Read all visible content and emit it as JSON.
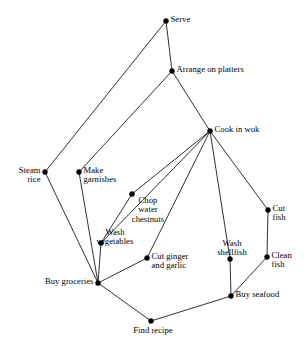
{
  "diagram": {
    "type": "node-link-graph",
    "width": 307,
    "height": 341,
    "background_color": "#ffffff",
    "node_color": "#000000",
    "edge_color": "#1a1a1a",
    "nodes": [
      {
        "id": "serve",
        "label": "Serve",
        "x": 166,
        "y": 21,
        "anchor": "right",
        "lines": [
          "Serve"
        ]
      },
      {
        "id": "arrange",
        "label": "Arrange on platters",
        "x": 172,
        "y": 71,
        "anchor": "right",
        "lines": [
          "Arrange on platters"
        ]
      },
      {
        "id": "cook",
        "label": "Cook in wok",
        "x": 210,
        "y": 131,
        "anchor": "right",
        "lines": [
          "Cook in wok"
        ]
      },
      {
        "id": "steam",
        "label": "Steam rice",
        "x": 45,
        "y": 172,
        "anchor": "left",
        "lines": [
          "Steam",
          "rice"
        ]
      },
      {
        "id": "garnishes",
        "label": "Make garnishes",
        "x": 79,
        "y": 172,
        "anchor": "right",
        "lines": [
          "Make",
          "garnishes"
        ]
      },
      {
        "id": "chestnuts",
        "label": "Chop water chestnuts",
        "x": 132,
        "y": 194,
        "anchor": "below",
        "lines": [
          "Chop",
          "water",
          "chestnuts"
        ]
      },
      {
        "id": "cutfish",
        "label": "Cut fish",
        "x": 268,
        "y": 210,
        "anchor": "right",
        "lines": [
          "Cut",
          "fish"
        ]
      },
      {
        "id": "washveg",
        "label": "Wash vegetables",
        "x": 101,
        "y": 243,
        "anchor": "above",
        "lines": [
          "Wash",
          "vegetables"
        ]
      },
      {
        "id": "ginger",
        "label": "Cut ginger and garlic",
        "x": 147,
        "y": 258,
        "anchor": "right",
        "lines": [
          "Cut ginger",
          "and garlic"
        ]
      },
      {
        "id": "washshell",
        "label": "Wash shellfish",
        "x": 230,
        "y": 259,
        "anchor": "above",
        "lines": [
          "Wash",
          "shellfish"
        ]
      },
      {
        "id": "cleanfish",
        "label": "Clean fish",
        "x": 267,
        "y": 257,
        "anchor": "right",
        "lines": [
          "Clean",
          "fish"
        ]
      },
      {
        "id": "groceries",
        "label": "Buy groceries",
        "x": 98,
        "y": 283,
        "anchor": "left",
        "lines": [
          "Buy groceries"
        ]
      },
      {
        "id": "seafood",
        "label": "Buy seafood",
        "x": 231,
        "y": 296,
        "anchor": "right",
        "lines": [
          "Buy seafood"
        ]
      },
      {
        "id": "recipe",
        "label": "Find recipe",
        "x": 151,
        "y": 321,
        "anchor": "below",
        "lines": [
          "Find recipe"
        ]
      }
    ],
    "edges": [
      {
        "from": "steam",
        "to": "serve"
      },
      {
        "from": "serve",
        "to": "arrange"
      },
      {
        "from": "garnishes",
        "to": "arrange"
      },
      {
        "from": "arrange",
        "to": "cook"
      },
      {
        "from": "cook",
        "to": "chestnuts"
      },
      {
        "from": "cook",
        "to": "ginger"
      },
      {
        "from": "cook",
        "to": "washshell"
      },
      {
        "from": "cook",
        "to": "cutfish"
      },
      {
        "from": "cook",
        "to": "washveg"
      },
      {
        "from": "chestnuts",
        "to": "washveg"
      },
      {
        "from": "steam",
        "to": "groceries"
      },
      {
        "from": "garnishes",
        "to": "groceries"
      },
      {
        "from": "washveg",
        "to": "groceries"
      },
      {
        "from": "ginger",
        "to": "groceries"
      },
      {
        "from": "groceries",
        "to": "recipe"
      },
      {
        "from": "recipe",
        "to": "seafood"
      },
      {
        "from": "washshell",
        "to": "seafood"
      },
      {
        "from": "cleanfish",
        "to": "seafood"
      },
      {
        "from": "cutfish",
        "to": "cleanfish"
      }
    ]
  }
}
